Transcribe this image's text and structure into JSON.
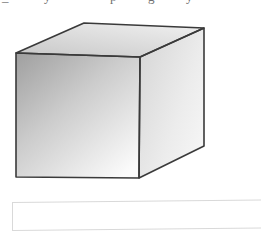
{
  "page": {
    "width": 261,
    "height": 238,
    "background": "#ffffff"
  },
  "clipped_text_above": {
    "note": "Bottom-most pixels of descenders from a text line cropped off at the top of the image",
    "glyphs": [
      "_",
      "y",
      "p",
      "g",
      "y"
    ]
  },
  "figure": {
    "name": "cuboid-illustration",
    "label": "",
    "shape_type": "rectangular prism",
    "outline_color": "#3a3a3a",
    "outline_width": 1.6,
    "faces": [
      {
        "name": "front-face",
        "points": "16,53 140,57 139,178 16,177",
        "gradient_from": "#9f9f9f",
        "gradient_to": "#fbfbfb",
        "gradient_angle_deg": 135
      },
      {
        "name": "top-face",
        "points": "16,53 84,23 204,28 140,57",
        "gradient_from": "#c9c9c9",
        "gradient_to": "#efefef",
        "gradient_angle_deg": 200
      },
      {
        "name": "right-face",
        "points": "140,57 204,28 204,146 139,178",
        "gradient_from": "#d6d6d6",
        "gradient_to": "#f7f7f7",
        "gradient_angle_deg": 160
      }
    ],
    "vertices": {
      "front_top_left": [
        16,
        53
      ],
      "front_top_right": [
        140,
        57
      ],
      "front_bottom_right": [
        139,
        178
      ],
      "front_bottom_left": [
        16,
        177
      ],
      "back_top_left": [
        84,
        23
      ],
      "back_top_right": [
        204,
        28
      ],
      "back_bottom_right": [
        204,
        146
      ]
    }
  },
  "caption_box": {
    "name": "caption-box",
    "text": "",
    "border_color": "#d9d9d9",
    "fill_color": "#ffffff",
    "x": 12,
    "y": 202,
    "width": 260,
    "height": 29
  }
}
